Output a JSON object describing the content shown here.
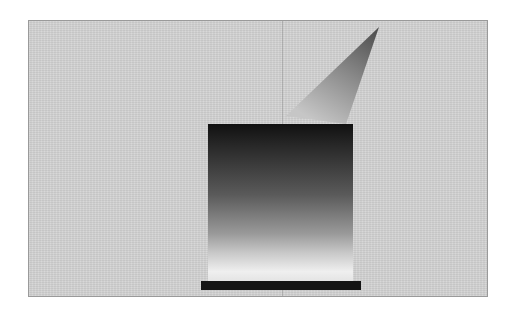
{
  "figure": {
    "colors": {
      "background": "#d4d4d4",
      "border": "#9a9a9a",
      "box_top": "#111111",
      "box_bottom": "#efefef",
      "base_bar": "#141414",
      "beam_tip": "#555555",
      "beam_base": "#c0c0c0"
    },
    "elements": [
      {
        "name": "background-panel"
      },
      {
        "name": "vertical-guide-line"
      },
      {
        "name": "light-beam-cone"
      },
      {
        "name": "gradient-box"
      },
      {
        "name": "base-bar"
      }
    ]
  }
}
